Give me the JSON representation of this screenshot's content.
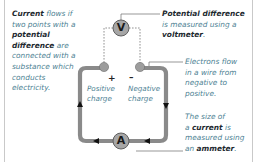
{
  "diagram": {
    "colors": {
      "wire": "#8a8a8a",
      "meter_fill": "#a6a6a6",
      "meter_stroke": "#5f5f5f",
      "text_body": "#4d7f93",
      "text_bold": "#1e2a30",
      "leader": "#6b6b6b",
      "frame": "#c9c9c9"
    },
    "left_note": {
      "segments": [
        {
          "text": "Current",
          "bold": true
        },
        {
          "text": " flows if two points with a ",
          "bold": false
        },
        {
          "text": "potential difference",
          "bold": true
        },
        {
          "text": " are connected with a substance which conducts electricity.",
          "bold": false
        }
      ]
    },
    "voltmeter_note": {
      "line1": "Potential difference",
      "line2": "is measured using a",
      "line3_bold": "voltmeter",
      "line3_end": "."
    },
    "electrons_note": {
      "lines": [
        "Electrons flow",
        "in a wire from",
        "negative to",
        "positive."
      ]
    },
    "ammeter_note": {
      "line1": "The size of",
      "line2_pre": "a ",
      "line2_bold": "current",
      "line2_post": " is",
      "line3": "measured using",
      "line4_pre": "an ",
      "line4_bold": "ammeter",
      "line4_post": "."
    },
    "terminals": {
      "positive_sign": "+",
      "negative_sign": "–",
      "positive_label": [
        "Positive",
        "charge"
      ],
      "negative_label": [
        "Negative",
        "charge"
      ]
    },
    "meters": {
      "voltmeter_symbol": "V",
      "ammeter_symbol": "A"
    }
  }
}
